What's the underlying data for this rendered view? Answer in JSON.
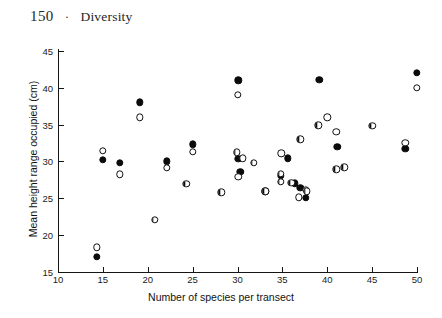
{
  "page": {
    "number": "150",
    "separator": "·",
    "running_title": "Diversity"
  },
  "chart_data": {
    "type": "scatter",
    "title": "",
    "xlabel": "Number of species per transect",
    "ylabel": "Mean height range occupied (cm)",
    "xlim": [
      10,
      50
    ],
    "ylim": [
      15,
      45
    ],
    "xticks": [
      10,
      15,
      20,
      25,
      30,
      35,
      40,
      45,
      50
    ],
    "yticks": [
      15,
      20,
      25,
      30,
      35,
      40,
      45
    ],
    "grid": false,
    "legend": "none",
    "marker_styles": {
      "filled": "filled-circle",
      "open": "open-circle",
      "half": "half-filled-circle"
    },
    "series": [
      {
        "name": "filled",
        "marker": "filled",
        "points": [
          [
            14.3,
            17.0
          ],
          [
            15.0,
            30.2
          ],
          [
            16.9,
            29.8
          ],
          [
            19.1,
            38.0
          ],
          [
            22.1,
            30.0
          ],
          [
            25.0,
            32.3
          ],
          [
            30.1,
            41.0
          ],
          [
            30.1,
            30.3
          ],
          [
            30.3,
            28.6
          ],
          [
            33.1,
            25.9
          ],
          [
            35.6,
            30.4
          ],
          [
            34.8,
            28.0
          ],
          [
            36.4,
            27.0
          ],
          [
            37.0,
            26.4
          ],
          [
            37.6,
            25.0
          ],
          [
            39.1,
            41.1
          ],
          [
            41.1,
            32.0
          ],
          [
            48.7,
            31.7
          ],
          [
            50.0,
            42.0
          ]
        ]
      },
      {
        "name": "open",
        "marker": "open",
        "points": [
          [
            14.3,
            18.3
          ],
          [
            15.0,
            31.4
          ],
          [
            16.9,
            28.2
          ],
          [
            19.1,
            36.0
          ],
          [
            22.1,
            29.1
          ],
          [
            25.0,
            31.3
          ],
          [
            30.0,
            39.0
          ],
          [
            30.6,
            30.4
          ],
          [
            30.1,
            27.9
          ],
          [
            34.9,
            31.1
          ],
          [
            36.8,
            25.1
          ],
          [
            37.6,
            26.1
          ],
          [
            40.0,
            36.0
          ],
          [
            41.0,
            34.0
          ],
          [
            48.7,
            32.5
          ],
          [
            50.0,
            40.0
          ]
        ]
      },
      {
        "name": "half",
        "marker": "half",
        "points": [
          [
            20.8,
            22.0
          ],
          [
            24.3,
            26.9
          ],
          [
            28.2,
            25.8
          ],
          [
            29.9,
            31.2
          ],
          [
            31.8,
            29.8
          ],
          [
            33.1,
            25.9
          ],
          [
            34.8,
            28.3
          ],
          [
            34.8,
            27.2
          ],
          [
            36.0,
            27.1
          ],
          [
            37.7,
            25.9
          ],
          [
            37.0,
            33.0
          ],
          [
            39.0,
            34.9
          ],
          [
            41.0,
            28.9
          ],
          [
            41.9,
            29.2
          ],
          [
            45.0,
            34.8
          ]
        ]
      }
    ]
  }
}
